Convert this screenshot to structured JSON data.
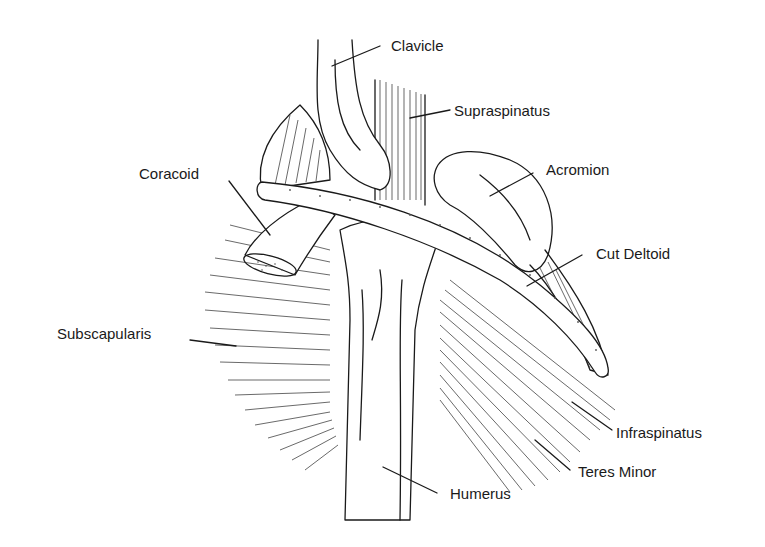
{
  "figure": {
    "labels": [
      {
        "id": "clavicle",
        "text": "Clavicle"
      },
      {
        "id": "supraspinatus",
        "text": "Supraspinatus"
      },
      {
        "id": "acromion",
        "text": "Acromion"
      },
      {
        "id": "coracoid",
        "text": "Coracoid"
      },
      {
        "id": "cut_deltoid",
        "text": "Cut Deltoid"
      },
      {
        "id": "subscapularis",
        "text": "Subscapularis"
      },
      {
        "id": "infraspinatus",
        "text": "Infraspinatus"
      },
      {
        "id": "teres_minor",
        "text": "Teres Minor"
      },
      {
        "id": "humerus",
        "text": "Humerus"
      }
    ]
  },
  "colors": {
    "ink": "#1a1a1a",
    "background": "#ffffff"
  }
}
